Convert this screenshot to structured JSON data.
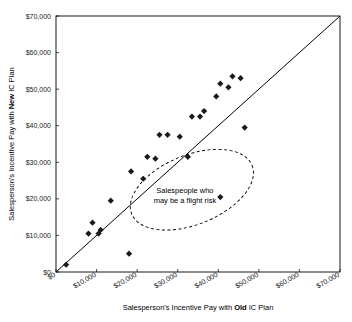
{
  "chart_data": {
    "type": "scatter",
    "title": "",
    "xlabel_parts": {
      "pre": "Salesperson's Incentive Pay with ",
      "bold": "Old",
      "post": " IC Plan"
    },
    "ylabel_parts": {
      "pre": "Salesperson's Incentive Pay with ",
      "bold": "New",
      "post": " IC Plan"
    },
    "xlabel": "Salesperson's Incentive Pay with Old IC Plan",
    "ylabel": "Salesperson's Incentive Pay with New IC Plan",
    "xlim": [
      0,
      70000
    ],
    "ylim": [
      0,
      70000
    ],
    "xticks": [
      "$0",
      "$10,000",
      "$20,000",
      "$30,000",
      "$40,000",
      "$50,000",
      "$60,000",
      "$70,000"
    ],
    "yticks": [
      "$0",
      "$10,000",
      "$20,000",
      "$30,000",
      "$40,000",
      "$50,000",
      "$60,000",
      "$70,000"
    ],
    "xtick_values": [
      0,
      10000,
      20000,
      30000,
      40000,
      50000,
      60000,
      70000
    ],
    "ytick_values": [
      0,
      10000,
      20000,
      30000,
      40000,
      50000,
      60000,
      70000
    ],
    "grid": false,
    "legend": "none",
    "reference_line": {
      "type": "diagonal",
      "from": [
        0,
        0
      ],
      "to": [
        70000,
        70000
      ]
    },
    "marker": "diamond",
    "marker_color": "#1a1a1a",
    "points": [
      [
        2500,
        2000
      ],
      [
        8000,
        10500
      ],
      [
        9000,
        13500
      ],
      [
        10500,
        10500
      ],
      [
        11000,
        11500
      ],
      [
        13500,
        19500
      ],
      [
        18000,
        5000
      ],
      [
        18500,
        27500
      ],
      [
        21500,
        25500
      ],
      [
        22500,
        31500
      ],
      [
        24500,
        31000
      ],
      [
        25500,
        37500
      ],
      [
        27500,
        37500
      ],
      [
        30500,
        37000
      ],
      [
        32500,
        31500
      ],
      [
        33500,
        42500
      ],
      [
        35500,
        42500
      ],
      [
        36500,
        44000
      ],
      [
        39500,
        48000
      ],
      [
        40500,
        51500
      ],
      [
        40500,
        20500
      ],
      [
        42500,
        50500
      ],
      [
        43500,
        53500
      ],
      [
        45500,
        53000
      ],
      [
        46500,
        39500
      ]
    ],
    "annotation": {
      "text_line1": "Salespeople who",
      "text_line2": "may be a flight risk",
      "shape": "dashed-ellipse",
      "ellipse_center": [
        33500,
        22500
      ],
      "ellipse_rx": 16000,
      "ellipse_ry": 9500,
      "ellipse_rotation": -22
    }
  }
}
